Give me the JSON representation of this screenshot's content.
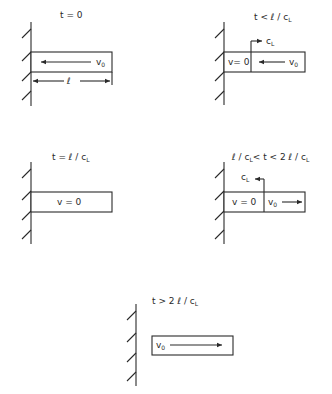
{
  "panels": [
    {
      "id": "p1",
      "condition": "t = 0",
      "bar_label": "v",
      "bar_label_sub": "0",
      "arrow_direction": "left",
      "dimension_label": "ℓ"
    },
    {
      "id": "p2",
      "condition": "t < ℓ / c",
      "condition_sub": "L",
      "left_region_label": "v= 0",
      "right_region_label": "v",
      "right_region_sub": "0",
      "wave_label": "c",
      "wave_sub": "L",
      "arrow_direction": "left",
      "wave_direction": "right"
    },
    {
      "id": "p3",
      "condition": "t = ℓ / c",
      "condition_sub": "L",
      "bar_label": "v = 0"
    },
    {
      "id": "p4",
      "condition_a": "ℓ / c",
      "condition_a_sub": "L",
      "condition_b": "< t < 2 ℓ / c",
      "condition_b_sub": "L",
      "left_region_label": "v = 0",
      "right_region_label": "v",
      "right_region_sub": "0",
      "wave_label": "c",
      "wave_sub": "L",
      "arrow_direction": "right",
      "wave_direction": "left"
    },
    {
      "id": "p5",
      "condition": "t > 2 ℓ / c",
      "condition_sub": "L",
      "bar_label": "v",
      "bar_label_sub": "0",
      "arrow_direction": "right"
    }
  ],
  "colors": {
    "ink": "#2a2a2a",
    "background": "#ffffff"
  }
}
